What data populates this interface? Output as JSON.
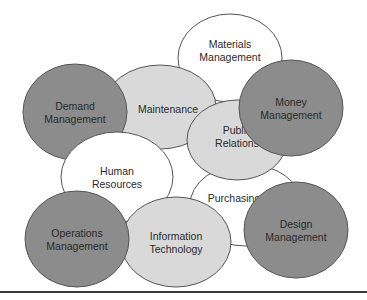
{
  "diagram": {
    "colors": {
      "dark": "#8c8c8c",
      "light": "#d9d9d9",
      "white": "#ffffff",
      "stroke": "#555555",
      "text": "#2a2a2a"
    },
    "nodes": [
      {
        "id": "materials-management",
        "lines": [
          "Materials",
          "Management"
        ],
        "tone": "white"
      },
      {
        "id": "demand-management",
        "lines": [
          "Demand",
          "Management"
        ],
        "tone": "dark"
      },
      {
        "id": "maintenance",
        "lines": [
          "Maintenance"
        ],
        "tone": "light"
      },
      {
        "id": "money-management",
        "lines": [
          "Money",
          "Management"
        ],
        "tone": "dark"
      },
      {
        "id": "public-relations",
        "lines": [
          "Public",
          "Relations"
        ],
        "tone": "light"
      },
      {
        "id": "human-resources",
        "lines": [
          "Human",
          "Resources"
        ],
        "tone": "white"
      },
      {
        "id": "purchasing",
        "lines": [
          "Purchasing"
        ],
        "tone": "white"
      },
      {
        "id": "operations-management",
        "lines": [
          "Operations",
          "Management"
        ],
        "tone": "dark"
      },
      {
        "id": "information-technology",
        "lines": [
          "Information",
          "Technology"
        ],
        "tone": "light"
      },
      {
        "id": "design-management",
        "lines": [
          "Design",
          "Management"
        ],
        "tone": "dark"
      }
    ]
  }
}
